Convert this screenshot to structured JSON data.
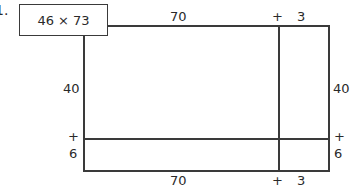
{
  "problem": {
    "number_label": "1.",
    "expression": "46 × 73"
  },
  "area_model": {
    "top_labels": {
      "tens": "70",
      "plus": "+",
      "ones": "3"
    },
    "bottom_labels": {
      "tens": "70",
      "plus": "+",
      "ones": "3"
    },
    "left_labels": {
      "tens": "40",
      "plus": "+",
      "ones": "6"
    },
    "right_labels": {
      "tens": "40",
      "plus": "+",
      "ones": "6"
    },
    "colors": {
      "line": "#3a3a3a",
      "text": "#2a2a2a",
      "background": "#ffffff"
    }
  }
}
